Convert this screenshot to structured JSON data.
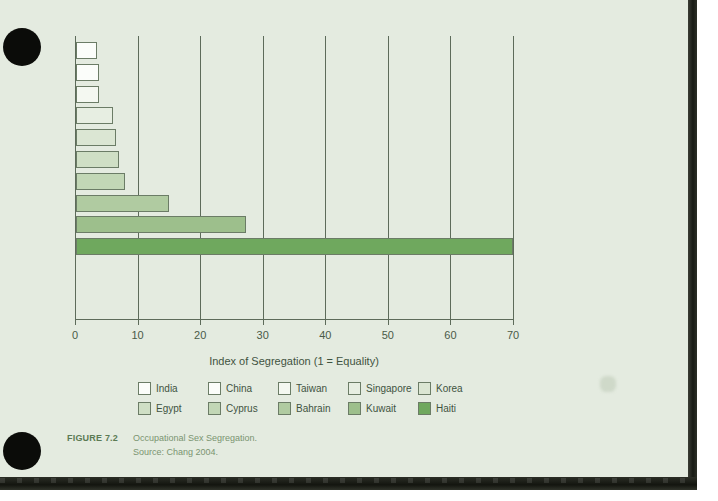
{
  "figure": {
    "tag": "FIGURE 7.2",
    "title": "Occupational Sex Segregation.",
    "source": "Source: Chang 2004."
  },
  "chart_data": {
    "type": "bar",
    "orientation": "horizontal",
    "title": "",
    "xlabel": "Index of Segregation (1 = Equality)",
    "ylabel": "",
    "xlim": [
      0,
      70
    ],
    "xticks": [
      0,
      10,
      20,
      30,
      40,
      50,
      60,
      70
    ],
    "grid": "vertical",
    "legend_position": "bottom",
    "categories": [
      "India",
      "China",
      "Taiwan",
      "Singapore",
      "Korea",
      "Egypt",
      "Cyprus",
      "Bahrain",
      "Kuwait",
      "Haiti"
    ],
    "values": [
      3.3,
      3.7,
      3.7,
      5.9,
      6.4,
      6.9,
      7.8,
      14.9,
      27.2,
      69.8
    ],
    "colors": [
      "#fbfdfa",
      "#fbfdfa",
      "#f4f8f1",
      "#e7eee2",
      "#dbe6d3",
      "#cfdfc5",
      "#c2d7b6",
      "#b0cba1",
      "#9dbf8c",
      "#6fa85e"
    ],
    "bar_edge_color": "#6b7c66",
    "axis_color": "#5d6b5a"
  },
  "legend": {
    "rows": [
      [
        {
          "label": "India",
          "color": "#fbfdfa"
        },
        {
          "label": "China",
          "color": "#fbfdfa"
        },
        {
          "label": "Taiwan",
          "color": "#f4f8f1"
        },
        {
          "label": "Singapore",
          "color": "#e7eee2"
        },
        {
          "label": "Korea",
          "color": "#dbe6d3"
        }
      ],
      [
        {
          "label": "Egypt",
          "color": "#cfdfc5"
        },
        {
          "label": "Cyprus",
          "color": "#c2d7b6"
        },
        {
          "label": "Bahrain",
          "color": "#b0cba1"
        },
        {
          "label": "Kuwait",
          "color": "#9dbf8c"
        },
        {
          "label": "Haiti",
          "color": "#6fa85e"
        }
      ]
    ]
  },
  "page": {
    "background_color": "#e4ebe0",
    "edge_color": "#171a14"
  }
}
